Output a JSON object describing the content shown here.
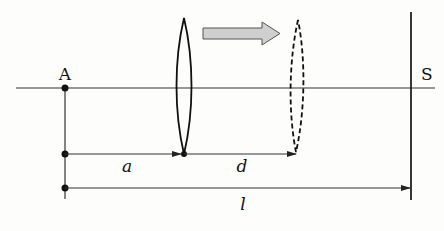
{
  "diagram": {
    "labels": {
      "point": "A",
      "screen": "S",
      "dist_a": "a",
      "dist_d": "d",
      "dist_l": "l"
    },
    "colors": {
      "line": "#222222",
      "arrow_fill": "#cfcfcf",
      "arrow_stroke": "#555555",
      "background": "#fdfdfb"
    },
    "geometry": {
      "axis_y": 88,
      "point_A_x": 65,
      "lens_initial_x": 184,
      "lens_final_x": 298,
      "screen_x": 411,
      "dim_row_1_y": 154,
      "dim_row_2_y": 188
    }
  }
}
